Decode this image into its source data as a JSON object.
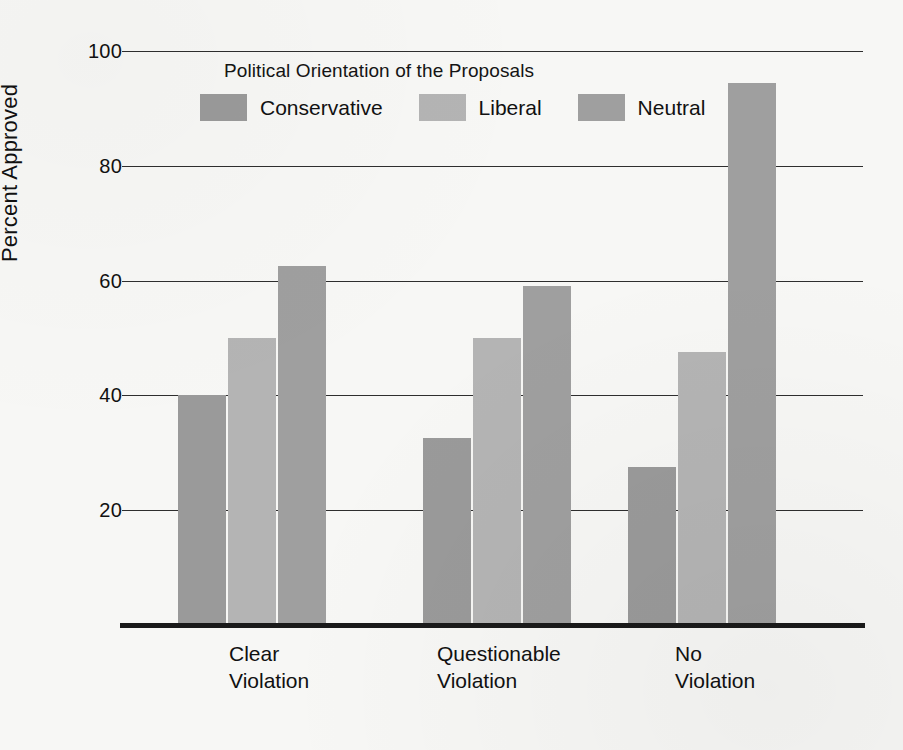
{
  "chart_data": {
    "type": "bar",
    "title": "Political Orientation of the Proposals",
    "xlabel": "",
    "ylabel": "Percent Approved",
    "ylim": [
      0,
      100
    ],
    "yticks": [
      20,
      40,
      60,
      80,
      100
    ],
    "grid": true,
    "legend_position": "top-center",
    "categories": [
      "Clear Violation",
      "Questionable Violation",
      "No Violation"
    ],
    "category_lines": [
      [
        "Clear",
        "Violation"
      ],
      [
        "Questionable",
        "Violation"
      ],
      [
        "No",
        "Violation"
      ]
    ],
    "series": [
      {
        "name": "Conservative",
        "color": "#9a9a9a",
        "values": [
          40,
          32.5,
          27.5
        ]
      },
      {
        "name": "Liberal",
        "color": "#b4b4b4",
        "values": [
          50,
          50,
          47.5
        ]
      },
      {
        "name": "Neutral",
        "color": "#9f9f9f",
        "values": [
          62.5,
          59,
          94.5
        ]
      }
    ]
  },
  "axes": {
    "y_title": "Percent Approved",
    "y_tick_labels": [
      "100",
      "80",
      "60",
      "40",
      "20"
    ]
  },
  "legend": {
    "title": "Political Orientation of the Proposals",
    "items": [
      {
        "label": "Conservative",
        "swatch": "conservative"
      },
      {
        "label": "Liberal",
        "swatch": "liberal"
      },
      {
        "label": "Neutral",
        "swatch": "neutral"
      }
    ]
  },
  "x_axis": {
    "groups": [
      {
        "line1": "Clear",
        "line2": "Violation"
      },
      {
        "line1": "Questionable",
        "line2": "Violation"
      },
      {
        "line1": "No",
        "line2": "Violation"
      }
    ]
  },
  "colors": {
    "conservative": "#9a9a9a",
    "liberal": "#b4b4b4",
    "neutral": "#9f9f9f",
    "axis": "#1a1a1a",
    "background": "#f7f7f5"
  }
}
